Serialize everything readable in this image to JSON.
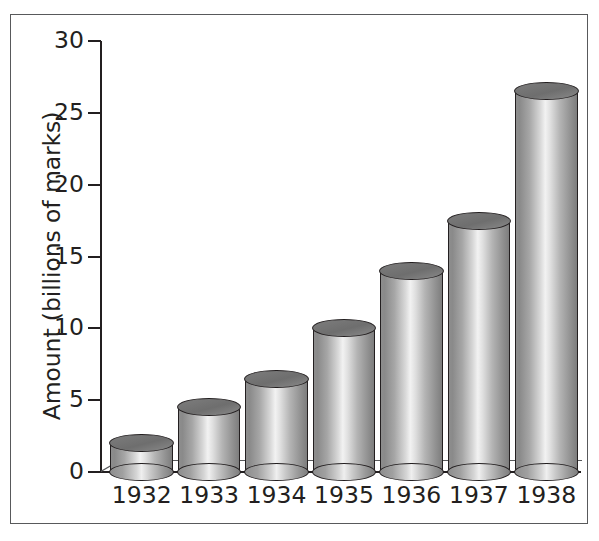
{
  "figure": {
    "frame_color": "#58595b",
    "background": "#ffffff"
  },
  "chart_data": {
    "type": "bar",
    "title": "",
    "xlabel": "",
    "ylabel": "Amount (billions of marks)",
    "categories": [
      "1932",
      "1933",
      "1934",
      "1935",
      "1936",
      "1937",
      "1938"
    ],
    "values": [
      2,
      4.5,
      6.5,
      10,
      14,
      17.5,
      26.5
    ],
    "ylim": [
      0,
      30
    ],
    "yticks": [
      0,
      5,
      10,
      15,
      20,
      25,
      30
    ],
    "ytick_labels": [
      "0",
      "5",
      "10",
      "15",
      "20",
      "25",
      "30"
    ],
    "grid": false,
    "legend": null,
    "style": "3d-cylinder",
    "bar_color": "#b4b4b4",
    "bar_outline": "#231f20"
  }
}
